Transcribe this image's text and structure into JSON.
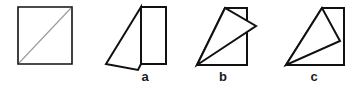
{
  "figure": {
    "background_color": "#ffffff",
    "stroke_color": "#111111",
    "fold_line_color": "#9a9a9a",
    "stroke_width": 2,
    "fold_line_width": 1,
    "width": 359,
    "height": 92
  },
  "labels": {
    "a": "a",
    "b": "b",
    "c": "c"
  },
  "shapes": {
    "original_square": {
      "name": "original-square",
      "description": "Plain square with a light diagonal fold line from bottom-left corner to top-right corner",
      "outline_points": "18,7 72,7 72,64 18,64",
      "fold_line": {
        "x1": 19,
        "y1": 63,
        "x2": 71,
        "y2": 8
      }
    },
    "option_a": {
      "name": "option-a-shape",
      "description": "Tall rectangle with a triangular flap folded down and to the left",
      "rectangle_points": "141,7 166,7 166,64 141,64",
      "flap_points": "141,7 106,64 138,70 141,64"
    },
    "option_b": {
      "name": "option-b-shape",
      "description": "Square with a triangular flap rotated outward past the right edge",
      "square_points": "197,65 247,65 247,8 225,8",
      "flap_points": "225,8 197,65 256,26"
    },
    "option_c": {
      "name": "option-c-shape",
      "description": "Square with a triangular flap folded inward, apex resting on the right edge",
      "square_points": "286,65 344,65 344,8 322,8",
      "flap_points": "322,8 286,65 340,41"
    }
  }
}
